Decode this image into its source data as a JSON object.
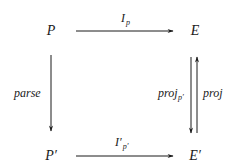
{
  "diagram": {
    "type": "commutative-diagram",
    "colors": {
      "ink": "#1a1a1a",
      "background": "#ffffff"
    },
    "nodes": {
      "top_left": {
        "label": "P"
      },
      "top_right": {
        "label": "E"
      },
      "bottom_left": {
        "label": "P′"
      },
      "bottom_right": {
        "label": "E′"
      }
    },
    "arrows": {
      "top": {
        "from": "P",
        "to": "E",
        "label": "I",
        "subscript": "p"
      },
      "bottom": {
        "from": "P′",
        "to": "E′",
        "label": "I′",
        "subscript": "p′"
      },
      "left": {
        "from": "P",
        "to": "P′",
        "label": "parse"
      },
      "right_down": {
        "from": "E",
        "to": "E′",
        "label": "proj",
        "subscript": "p′"
      },
      "right_up": {
        "from": "E′",
        "to": "E",
        "label": "proj"
      }
    }
  }
}
